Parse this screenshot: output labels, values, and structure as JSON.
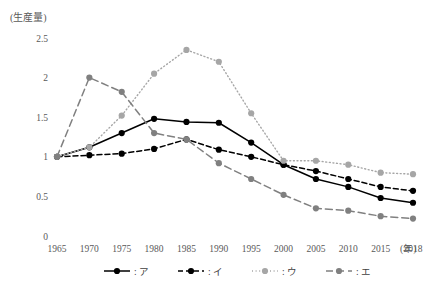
{
  "chart_data": {
    "type": "line",
    "title": "",
    "subtitle": "",
    "ylabel": "(生産量)",
    "xlabel": "(年)",
    "x": [
      1965,
      1970,
      1975,
      1980,
      1985,
      1990,
      1995,
      2000,
      2005,
      2010,
      2015,
      2018
    ],
    "categories": [
      "1965",
      "1970",
      "1975",
      "1980",
      "1985",
      "1990",
      "1995",
      "2000",
      "2005",
      "2010",
      "2015",
      "2018"
    ],
    "ylim": [
      0,
      2.5
    ],
    "yticks": [
      0,
      0.5,
      1,
      1.5,
      2,
      2.5
    ],
    "ytick_labels": [
      "0",
      "0.5",
      "1",
      "1.5",
      "2",
      "2.5"
    ],
    "grid": false,
    "legend_position": "bottom",
    "series": [
      {
        "name": "ア",
        "legend_label": ": ア",
        "color": "#000000",
        "style": "solid",
        "marker": "circle",
        "values": [
          1.0,
          1.12,
          1.3,
          1.48,
          1.44,
          1.43,
          1.18,
          0.9,
          0.72,
          0.62,
          0.48,
          0.42
        ]
      },
      {
        "name": "イ",
        "legend_label": ": イ",
        "color": "#000000",
        "style": "dashed",
        "marker": "circle",
        "values": [
          1.0,
          1.02,
          1.04,
          1.1,
          1.22,
          1.09,
          1.0,
          0.9,
          0.82,
          0.72,
          0.62,
          0.57
        ]
      },
      {
        "name": "ウ",
        "legend_label": ": ウ",
        "color": "#a6a6a6",
        "style": "dotted",
        "marker": "circle",
        "values": [
          1.0,
          1.12,
          1.52,
          2.05,
          2.35,
          2.2,
          1.55,
          0.95,
          0.95,
          0.9,
          0.8,
          0.78
        ]
      },
      {
        "name": "エ",
        "legend_label": ": エ",
        "color": "#808080",
        "style": "dashdot",
        "marker": "circle",
        "values": [
          1.0,
          2.0,
          1.82,
          1.3,
          1.22,
          0.92,
          0.72,
          0.52,
          0.35,
          0.32,
          0.25,
          0.22
        ]
      }
    ]
  },
  "axis": {
    "y_caption": "(生産量)",
    "x_caption": "(年)"
  }
}
